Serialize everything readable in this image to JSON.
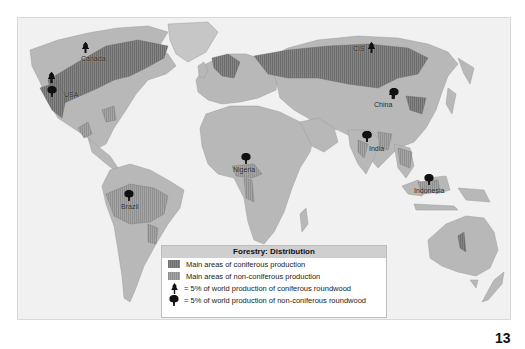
{
  "map": {
    "title": "Forestry: Distribution",
    "colors": {
      "ocean": "#f1f1f1",
      "land": "#b8b8b8",
      "coniferous": "#7a7a7a",
      "non_coniferous": "#9a9a9a",
      "symbol": "#111111"
    },
    "labels": [
      {
        "name": "Canada",
        "coniferous_symbols": 3,
        "non_coniferous_symbols": 0
      },
      {
        "name": "USA",
        "coniferous_symbols": 5,
        "non_coniferous_symbols": 1
      },
      {
        "name": "CIS",
        "coniferous_symbols": 2,
        "non_coniferous_symbols": 0
      },
      {
        "name": "China",
        "coniferous_symbols": 2,
        "non_coniferous_symbols": 1
      },
      {
        "name": "India",
        "coniferous_symbols": 0,
        "non_coniferous_symbols": 2
      },
      {
        "name": "Nigeria",
        "coniferous_symbols": 0,
        "non_coniferous_symbols": 1
      },
      {
        "name": "Brazil",
        "coniferous_symbols": 0,
        "non_coniferous_symbols": 1
      },
      {
        "name": "Indonesia",
        "coniferous_symbols": 0,
        "non_coniferous_symbols": 1
      }
    ]
  },
  "legend": {
    "title": "Forestry: Distribution",
    "items": [
      {
        "icon": "coniferous-area-swatch",
        "label": "Main areas of coniferous production"
      },
      {
        "icon": "non-coniferous-area-swatch",
        "label": "Main areas of non-coniferous production"
      },
      {
        "icon": "conifer-tree-icon",
        "label": "= 5% of world production of coniferous roundwood"
      },
      {
        "icon": "broadleaf-tree-icon",
        "label": "= 5% of world production of non-coniferous roundwood"
      }
    ]
  },
  "page": {
    "number": "13"
  }
}
